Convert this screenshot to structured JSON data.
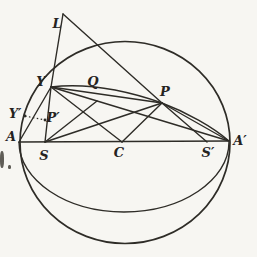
{
  "figure": {
    "name": "sphere-geometry-diagram",
    "ink_color": "#2e2c27",
    "background_color": "#f7f6f2",
    "stroke_width": 1.4,
    "outline_stroke_width": 1.7,
    "sphere": {
      "cx": 125,
      "cy": 142.5,
      "rx": 105,
      "ry": 101
    },
    "equator_path": "M 19 142 C 19 180, 66 212, 124 212 C 182 212, 229 180, 229 142",
    "upper_arc_path": "M 51 87 C 85 83, 125 90, 162 103 C 186 112, 213 127, 229 141",
    "points": {
      "L": [
        63,
        14
      ],
      "Y": [
        51,
        87
      ],
      "Q": [
        97,
        101
      ],
      "P": [
        162,
        103
      ],
      "Yp": [
        25,
        116
      ],
      "Pp": [
        45,
        120
      ],
      "A": [
        19,
        142
      ],
      "S": [
        45,
        142
      ],
      "C": [
        122,
        142
      ],
      "Sp": [
        207,
        142
      ],
      "Ap": [
        229,
        141
      ]
    },
    "segments": [
      [
        "L",
        "Y"
      ],
      [
        "Y",
        "S"
      ],
      [
        "L",
        "P"
      ],
      [
        "P",
        "Sp"
      ],
      [
        "A",
        "Y"
      ],
      [
        "Y",
        "P"
      ],
      [
        "Y",
        "Ap"
      ],
      [
        "Y",
        "C"
      ],
      [
        "C",
        "P"
      ],
      [
        "S",
        "Q"
      ],
      [
        "S",
        "P"
      ],
      [
        "P",
        "Ap"
      ],
      [
        "A",
        "Ap"
      ]
    ],
    "dotted_segments": [
      [
        "Yp",
        "Pp"
      ]
    ],
    "marked_points": [
      "Yp",
      "Pp"
    ],
    "labels": [
      {
        "id": "L",
        "text": "L",
        "x": 57,
        "y": 23
      },
      {
        "id": "Y",
        "text": "Y",
        "x": 41,
        "y": 81
      },
      {
        "id": "Q",
        "text": "Q",
        "x": 93,
        "y": 81
      },
      {
        "id": "P",
        "text": "P",
        "x": 165,
        "y": 91
      },
      {
        "id": "Y-prime",
        "text": "Y′",
        "x": 15,
        "y": 113
      },
      {
        "id": "P-prime",
        "text": "P′",
        "x": 53,
        "y": 117
      },
      {
        "id": "A",
        "text": "A",
        "x": 11,
        "y": 136
      },
      {
        "id": "S",
        "text": "S",
        "x": 44,
        "y": 155
      },
      {
        "id": "C",
        "text": "C",
        "x": 119,
        "y": 152
      },
      {
        "id": "S-prime",
        "text": "S′",
        "x": 208,
        "y": 152
      },
      {
        "id": "A-prime",
        "text": "A′",
        "x": 240,
        "y": 140
      }
    ],
    "artifacts": [
      {
        "x": 0,
        "y": 151,
        "w": 4,
        "h": 17
      },
      {
        "x": 8,
        "y": 165,
        "w": 3,
        "h": 4
      }
    ]
  }
}
